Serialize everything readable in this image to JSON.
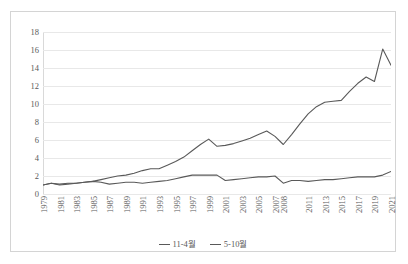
{
  "title_strip": "",
  "chart_data": {
    "type": "line",
    "title": "",
    "xlabel": "",
    "ylabel": "",
    "ylim": [
      0,
      18
    ],
    "ytick_step": 2,
    "yticks": [
      0,
      2,
      4,
      6,
      8,
      10,
      12,
      14,
      16,
      18
    ],
    "grid": true,
    "legend_position": "bottom",
    "x": [
      1979,
      1980,
      1981,
      1982,
      1983,
      1984,
      1985,
      1986,
      1987,
      1988,
      1989,
      1990,
      1991,
      1992,
      1993,
      1994,
      1995,
      1996,
      1997,
      1998,
      1999,
      2000,
      2001,
      2002,
      2003,
      2004,
      2005,
      2006,
      2007,
      2008,
      2009,
      2010,
      2011,
      2012,
      2013,
      2014,
      2015,
      2016,
      2017,
      2018,
      2019,
      2020,
      2021
    ],
    "xtick_labels": [
      "1979",
      "1981",
      "1983",
      "1985",
      "1987",
      "1989",
      "1991",
      "1993",
      "1995",
      "1997",
      "1999",
      "2001",
      "2003",
      "2005",
      "2007",
      "2008",
      "2011",
      "2013",
      "2015",
      "2017",
      "2019",
      "2021"
    ],
    "series": [
      {
        "name": "11-4월",
        "color": "#595959",
        "values": [
          1.0,
          1.2,
          1.1,
          1.2,
          1.2,
          1.3,
          1.4,
          1.6,
          1.8,
          2.0,
          2.1,
          2.3,
          2.6,
          2.8,
          2.8,
          3.2,
          3.6,
          4.1,
          4.8,
          5.5,
          6.1,
          5.3,
          5.4,
          5.6,
          5.9,
          6.2,
          6.6,
          7.0,
          6.4,
          5.5,
          6.6,
          7.8,
          8.9,
          9.7,
          10.2,
          10.3,
          10.4,
          11.4,
          12.3,
          13.0,
          12.5,
          16.1,
          14.3
        ]
      },
      {
        "name": "5-10월",
        "color": "#595959",
        "values": [
          1.0,
          1.2,
          1.0,
          1.1,
          1.2,
          1.3,
          1.4,
          1.3,
          1.1,
          1.2,
          1.3,
          1.3,
          1.2,
          1.3,
          1.4,
          1.5,
          1.7,
          1.9,
          2.1,
          2.1,
          2.1,
          2.1,
          1.5,
          1.6,
          1.7,
          1.8,
          1.9,
          1.9,
          2.0,
          1.2,
          1.5,
          1.5,
          1.4,
          1.5,
          1.6,
          1.6,
          1.7,
          1.8,
          1.9,
          1.9,
          1.9,
          2.1,
          2.5
        ]
      }
    ]
  },
  "legend": {
    "items": [
      {
        "label": "11-4월"
      },
      {
        "label": "5-10월"
      }
    ]
  }
}
